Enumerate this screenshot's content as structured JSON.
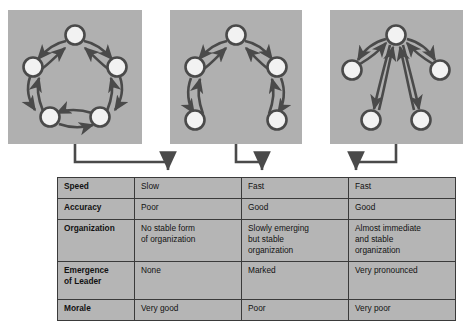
{
  "figure": {
    "kind": "communication-network-comparison",
    "background_color": "#ffffff",
    "panel_fill": "#b0b0b0",
    "node_fill": "#f2f2f2",
    "stroke_color": "#4a4a4a",
    "table_fill": "#b5b5b5",
    "table_border": "#3a3a3a"
  },
  "panels": [
    {
      "id": "circle-network",
      "name": "Circle network",
      "node_count": 5,
      "arrow_type": "bidirectional",
      "edges": 5,
      "nodes": [
        {
          "id": "n1",
          "x": 67,
          "y": 25
        },
        {
          "id": "n2",
          "x": 25,
          "y": 57
        },
        {
          "id": "n3",
          "x": 109,
          "y": 57
        },
        {
          "id": "n4",
          "x": 42,
          "y": 107
        },
        {
          "id": "n5",
          "x": 92,
          "y": 107
        }
      ]
    },
    {
      "id": "chain-network",
      "name": "Chain network",
      "node_count": 5,
      "arrow_type": "bidirectional",
      "edges": 4,
      "nodes": [
        {
          "id": "c1",
          "x": 66,
          "y": 25
        },
        {
          "id": "c2",
          "x": 25,
          "y": 57
        },
        {
          "id": "c3",
          "x": 107,
          "y": 57
        },
        {
          "id": "c4",
          "x": 25,
          "y": 110
        },
        {
          "id": "c5",
          "x": 107,
          "y": 110
        }
      ]
    },
    {
      "id": "wheel-network",
      "name": "Wheel network",
      "node_count": 5,
      "arrow_type": "bidirectional",
      "edges": 4,
      "nodes": [
        {
          "id": "w0",
          "x": 66,
          "y": 25
        },
        {
          "id": "w1",
          "x": 22,
          "y": 60
        },
        {
          "id": "w2",
          "x": 110,
          "y": 60
        },
        {
          "id": "w3",
          "x": 41,
          "y": 110
        },
        {
          "id": "w4",
          "x": 91,
          "y": 110
        }
      ]
    }
  ],
  "connectors": [
    {
      "id": "connector-circle",
      "from_panel": "circle-network",
      "to_column": 1
    },
    {
      "id": "connector-chain",
      "from_panel": "chain-network",
      "to_column": 2
    },
    {
      "id": "connector-wheel",
      "from_panel": "wheel-network",
      "to_column": 3
    }
  ],
  "table": {
    "row_headers": [
      "Speed",
      "Accuracy",
      "Organization",
      "Emergence\nof Leader",
      "Morale"
    ],
    "rows": [
      {
        "header": "Speed",
        "header_line1": "Speed",
        "header_line2": "",
        "cells": [
          "Slow",
          "Fast",
          "Fast"
        ]
      },
      {
        "header": "Accuracy",
        "header_line1": "Accuracy",
        "header_line2": "",
        "cells": [
          "Poor",
          "Good",
          "Good"
        ]
      },
      {
        "header": "Organization",
        "header_line1": "Organization",
        "header_line2": "",
        "cells": [
          "No stable form of organization",
          "Slowly emerging but stable organization",
          "Almost immediate and stable organization"
        ],
        "cell_lines": [
          [
            "No stable form",
            "of organization"
          ],
          [
            "Slowly emerging",
            "but stable",
            "organization"
          ],
          [
            "Almost immediate",
            "and stable",
            "organization"
          ]
        ]
      },
      {
        "header": "Emergence of Leader",
        "header_line1": "Emergence",
        "header_line2": "of Leader",
        "cells": [
          "None",
          "Marked",
          "Very pronounced"
        ]
      },
      {
        "header": "Morale",
        "header_line1": "Morale",
        "header_line2": "",
        "cells": [
          "Very good",
          "Poor",
          "Very poor"
        ]
      }
    ]
  }
}
